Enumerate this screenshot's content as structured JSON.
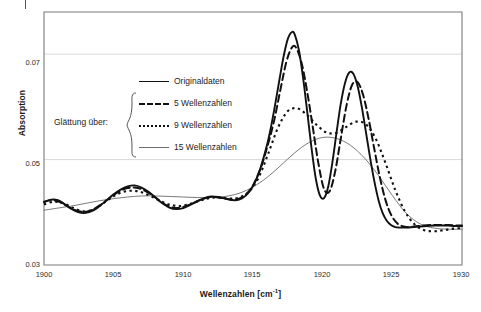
{
  "chart_data": {
    "type": "line",
    "title": "",
    "xlabel": "Wellenzahlen [cm",
    "xlabel_sup": "-1",
    "xlabel_close": "]",
    "ylabel": "Absorption",
    "xlim": [
      1900,
      1930
    ],
    "ylim": [
      0.03,
      0.078
    ],
    "xticks": [
      1900,
      1905,
      1910,
      1915,
      1920,
      1925,
      1930
    ],
    "yticks": [
      0.03,
      0.05,
      0.07
    ],
    "ytick_labels": [
      "0.03",
      "0.05",
      "0.07"
    ],
    "xtick_labels": [
      "1900",
      "1905",
      "1910",
      "1915",
      "1920",
      "1925",
      "1930"
    ],
    "grid": "horizontal",
    "legend_position": "upper-center-left",
    "group_label": "Glättung über:",
    "series": [
      {
        "name": "Originaldaten",
        "style": "solid",
        "width": 1.9,
        "color": "#111111",
        "x": [
          1900.0,
          1900.5,
          1901.0,
          1901.5,
          1902.0,
          1902.5,
          1903.0,
          1903.5,
          1904.0,
          1904.5,
          1905.0,
          1905.5,
          1906.0,
          1906.5,
          1907.0,
          1907.5,
          1908.0,
          1908.5,
          1909.0,
          1909.5,
          1910.0,
          1910.5,
          1911.0,
          1911.5,
          1912.0,
          1912.5,
          1913.0,
          1913.5,
          1914.0,
          1914.5,
          1915.0,
          1915.5,
          1916.0,
          1916.3,
          1916.6,
          1916.9,
          1917.2,
          1917.5,
          1917.8,
          1918.0,
          1918.3,
          1918.6,
          1918.9,
          1919.2,
          1919.5,
          1919.8,
          1920.1,
          1920.4,
          1920.7,
          1921.0,
          1921.3,
          1921.6,
          1921.9,
          1922.2,
          1922.5,
          1922.8,
          1923.1,
          1923.4,
          1923.7,
          1924.0,
          1924.3,
          1924.6,
          1924.9,
          1925.2,
          1925.5,
          1926.0,
          1926.5,
          1927.0,
          1927.5,
          1928.0,
          1928.5,
          1929.0,
          1929.5,
          1930.0
        ],
        "y": [
          0.0419,
          0.0424,
          0.0423,
          0.0415,
          0.0406,
          0.04,
          0.0399,
          0.0403,
          0.0412,
          0.0423,
          0.0434,
          0.0443,
          0.0449,
          0.0451,
          0.0447,
          0.0439,
          0.0428,
          0.0417,
          0.0409,
          0.0406,
          0.0408,
          0.0414,
          0.0421,
          0.0427,
          0.043,
          0.0429,
          0.0426,
          0.0423,
          0.0424,
          0.0432,
          0.045,
          0.0481,
          0.0527,
          0.0563,
          0.0606,
          0.0652,
          0.0696,
          0.0729,
          0.0742,
          0.0737,
          0.0707,
          0.0654,
          0.0589,
          0.0522,
          0.0465,
          0.0432,
          0.0427,
          0.0449,
          0.0495,
          0.0552,
          0.0606,
          0.0645,
          0.0665,
          0.0663,
          0.064,
          0.0601,
          0.0553,
          0.0504,
          0.046,
          0.0424,
          0.0399,
          0.0384,
          0.0376,
          0.0372,
          0.0371,
          0.0371,
          0.0372,
          0.0373,
          0.0374,
          0.0375,
          0.0375,
          0.0375,
          0.0374,
          0.0374
        ]
      },
      {
        "name": "5 Wellenzahlen",
        "style": "dashed",
        "width": 2.0,
        "color": "#111111",
        "x": [
          1900.0,
          1900.5,
          1901.0,
          1901.5,
          1902.0,
          1902.5,
          1903.0,
          1903.5,
          1904.0,
          1904.5,
          1905.0,
          1905.5,
          1906.0,
          1906.5,
          1907.0,
          1907.5,
          1908.0,
          1908.5,
          1909.0,
          1909.5,
          1910.0,
          1910.5,
          1911.0,
          1911.5,
          1912.0,
          1912.5,
          1913.0,
          1913.5,
          1914.0,
          1914.5,
          1915.0,
          1915.5,
          1916.0,
          1916.5,
          1917.0,
          1917.4,
          1917.8,
          1918.1,
          1918.5,
          1918.9,
          1919.3,
          1919.7,
          1920.1,
          1920.5,
          1920.9,
          1921.3,
          1921.7,
          1922.1,
          1922.5,
          1922.9,
          1923.3,
          1923.7,
          1924.1,
          1924.5,
          1924.9,
          1925.4,
          1926.0,
          1926.6,
          1927.2,
          1927.8,
          1928.4,
          1929.0,
          1929.6,
          1930.0
        ],
        "y": [
          0.042,
          0.0423,
          0.0421,
          0.0414,
          0.0407,
          0.0402,
          0.0401,
          0.0405,
          0.0413,
          0.0423,
          0.0433,
          0.0441,
          0.0446,
          0.0447,
          0.0444,
          0.0437,
          0.0428,
          0.0418,
          0.0411,
          0.0408,
          0.041,
          0.0415,
          0.0421,
          0.0426,
          0.0429,
          0.0428,
          0.0426,
          0.0424,
          0.0426,
          0.0434,
          0.0451,
          0.048,
          0.0522,
          0.0572,
          0.0637,
          0.0686,
          0.0713,
          0.0712,
          0.0682,
          0.0627,
          0.056,
          0.0492,
          0.0444,
          0.044,
          0.0478,
          0.054,
          0.0601,
          0.0641,
          0.0647,
          0.0623,
          0.0577,
          0.0521,
          0.0467,
          0.0424,
          0.0396,
          0.0378,
          0.0372,
          0.0373,
          0.0375,
          0.0376,
          0.0376,
          0.0376,
          0.0375,
          0.0375
        ]
      },
      {
        "name": "9 Wellenzahlen",
        "style": "dotted",
        "width": 2.1,
        "color": "#111111",
        "x": [
          1900.0,
          1900.7,
          1901.4,
          1902.1,
          1902.8,
          1903.5,
          1904.2,
          1904.9,
          1905.6,
          1906.3,
          1907.0,
          1907.7,
          1908.4,
          1909.1,
          1909.8,
          1910.5,
          1911.2,
          1911.9,
          1912.6,
          1913.3,
          1914.0,
          1914.7,
          1915.4,
          1916.1,
          1916.8,
          1917.5,
          1918.2,
          1918.9,
          1919.6,
          1920.3,
          1921.0,
          1921.7,
          1922.4,
          1923.1,
          1923.8,
          1924.5,
          1925.2,
          1925.9,
          1926.6,
          1927.3,
          1928.0,
          1928.7,
          1929.4,
          1930.0
        ],
        "y": [
          0.0415,
          0.042,
          0.0417,
          0.0408,
          0.0402,
          0.0405,
          0.0416,
          0.0429,
          0.0438,
          0.0441,
          0.0438,
          0.043,
          0.0421,
          0.0414,
          0.0412,
          0.0416,
          0.0422,
          0.0427,
          0.0428,
          0.0426,
          0.0428,
          0.0439,
          0.0466,
          0.0512,
          0.0561,
          0.0592,
          0.0597,
          0.0584,
          0.0565,
          0.0551,
          0.0551,
          0.0562,
          0.0572,
          0.0567,
          0.054,
          0.0494,
          0.0443,
          0.0402,
          0.0377,
          0.0366,
          0.0364,
          0.0366,
          0.0369,
          0.037
        ]
      },
      {
        "name": "15 Wellenzahlen",
        "style": "thin-solid",
        "width": 0.9,
        "color": "#6b6b6b",
        "x": [
          1900.0,
          1901.0,
          1902.0,
          1903.0,
          1904.0,
          1905.0,
          1906.0,
          1907.0,
          1908.0,
          1909.0,
          1910.0,
          1911.0,
          1912.0,
          1913.0,
          1914.0,
          1915.0,
          1916.0,
          1917.0,
          1918.0,
          1919.0,
          1920.0,
          1921.0,
          1922.0,
          1923.0,
          1924.0,
          1925.0,
          1926.0,
          1927.0,
          1928.0,
          1929.0,
          1930.0
        ],
        "y": [
          0.0404,
          0.0408,
          0.0412,
          0.0417,
          0.0422,
          0.0426,
          0.0429,
          0.0431,
          0.0431,
          0.043,
          0.0429,
          0.0428,
          0.0428,
          0.043,
          0.0436,
          0.0448,
          0.0466,
          0.0489,
          0.0513,
          0.0532,
          0.0542,
          0.054,
          0.0527,
          0.0503,
          0.047,
          0.0432,
          0.0398,
          0.0378,
          0.037,
          0.0368,
          0.0368
        ]
      }
    ]
  },
  "legend": {
    "items": [
      {
        "label": "Originaldaten",
        "style": "solid"
      },
      {
        "label": "5 Wellenzahlen",
        "style": "dashed"
      },
      {
        "label": "9 Wellenzahlen",
        "style": "dotted"
      },
      {
        "label": "15 Wellenzahlen",
        "style": "thin-solid"
      }
    ],
    "group_label": "Glättung über:"
  }
}
